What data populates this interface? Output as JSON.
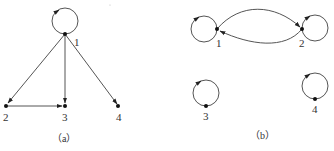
{
  "colors": {
    "edge": "#555555",
    "node": "#111111",
    "text": "#333333",
    "background": "#ffffff"
  },
  "graph_a": {
    "caption": "（a）",
    "nodes": [
      {
        "id": "1",
        "label": "1",
        "x": 65,
        "y": 34,
        "self_loop": true
      },
      {
        "id": "2",
        "label": "2",
        "x": 6,
        "y": 106,
        "self_loop": false
      },
      {
        "id": "3",
        "label": "3",
        "x": 65,
        "y": 106,
        "self_loop": false
      },
      {
        "id": "4",
        "label": "4",
        "x": 118,
        "y": 106,
        "self_loop": false
      }
    ],
    "edges": [
      {
        "from": "1",
        "to": "1"
      },
      {
        "from": "1",
        "to": "2"
      },
      {
        "from": "1",
        "to": "3"
      },
      {
        "from": "1",
        "to": "4"
      },
      {
        "from": "2",
        "to": "3"
      }
    ]
  },
  "graph_b": {
    "caption": "（b）",
    "nodes": [
      {
        "id": "1",
        "label": "1",
        "x": 217,
        "y": 29,
        "self_loop": true
      },
      {
        "id": "2",
        "label": "2",
        "x": 302,
        "y": 29,
        "self_loop": true
      },
      {
        "id": "3",
        "label": "3",
        "x": 206,
        "y": 106,
        "self_loop": true
      },
      {
        "id": "4",
        "label": "4",
        "x": 315,
        "y": 99,
        "self_loop": true
      }
    ],
    "edges": [
      {
        "from": "1",
        "to": "1"
      },
      {
        "from": "2",
        "to": "2"
      },
      {
        "from": "3",
        "to": "3"
      },
      {
        "from": "4",
        "to": "4"
      },
      {
        "from": "1",
        "to": "2"
      },
      {
        "from": "2",
        "to": "1"
      }
    ]
  }
}
